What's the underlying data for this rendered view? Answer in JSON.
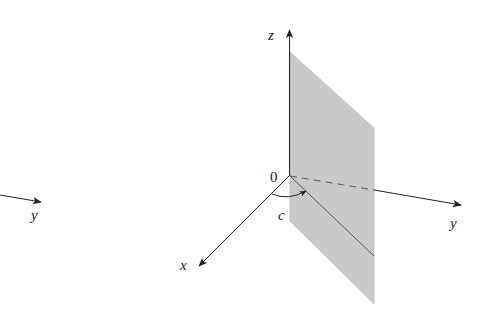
{
  "diagram": {
    "colors": {
      "axis": "#222222",
      "plane_fill": "#c9c9c9",
      "plane_edge": "#9a9a9a",
      "background": "#ffffff"
    },
    "left_fragment": {
      "axis_label": "y"
    },
    "main": {
      "origin_label": "0",
      "z_label": "z",
      "x_label": "x",
      "y_label": "y",
      "angle_label": "c"
    }
  }
}
